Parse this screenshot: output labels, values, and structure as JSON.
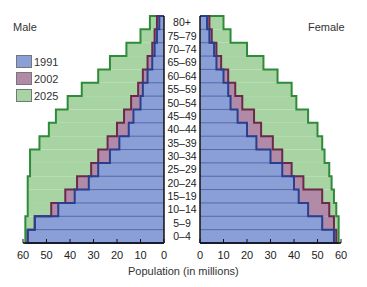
{
  "chart_data": {
    "type": "bar",
    "subtype": "population-pyramid",
    "title": "",
    "xlabel": "Population (in millions)",
    "ylabel": "",
    "side_labels": {
      "left": "Male",
      "right": "Female"
    },
    "categories": [
      "80+",
      "75–79",
      "70–74",
      "65–69",
      "60–64",
      "55–59",
      "50–54",
      "45–49",
      "40–44",
      "35–39",
      "30–34",
      "25–29",
      "20–24",
      "15–19",
      "10–14",
      "5–9",
      "0–4"
    ],
    "xlim": [
      60,
      0,
      60
    ],
    "x_ticks_left": [
      "60",
      "50",
      "40",
      "30",
      "20",
      "10",
      "0"
    ],
    "x_ticks_right": [
      "0",
      "10",
      "20",
      "30",
      "40",
      "50",
      "60"
    ],
    "legend": [
      "1991",
      "2002",
      "2025"
    ],
    "legend_position": "upper-left",
    "grid": false,
    "series": [
      {
        "name": "1991",
        "color": "#8a9fd6",
        "edge": "#2a3f8f",
        "male": [
          2,
          3,
          4,
          5,
          7,
          9,
          10,
          13,
          15,
          19,
          23,
          28,
          32,
          38,
          45,
          55,
          58
        ],
        "female": [
          3,
          4,
          6,
          7,
          10,
          12,
          13,
          16,
          20,
          24,
          30,
          35,
          40,
          42,
          46,
          52,
          57
        ]
      },
      {
        "name": "2002",
        "color": "#b08aa6",
        "edge": "#6b2a4a",
        "male": [
          3,
          4,
          5,
          7,
          9,
          11,
          14,
          17,
          20,
          24,
          28,
          31,
          37,
          42,
          48,
          55,
          58
        ],
        "female": [
          4,
          5,
          7,
          9,
          12,
          15,
          18,
          23,
          26,
          31,
          35,
          39,
          44,
          52,
          55,
          57,
          58
        ]
      },
      {
        "name": "2025",
        "color": "#a8d4a4",
        "edge": "#2e8b3a",
        "male": [
          6,
          10,
          16,
          23,
          28,
          35,
          41,
          46,
          49,
          53,
          57,
          57,
          58,
          58,
          58,
          59,
          59
        ],
        "female": [
          10,
          13,
          20,
          27,
          33,
          39,
          41,
          46,
          50,
          52,
          53,
          55,
          56,
          57,
          58,
          59,
          59
        ]
      }
    ]
  },
  "labels": {
    "male": "Male",
    "female": "Female",
    "x_title": "Population (in millions)"
  },
  "legend": [
    {
      "label": "1991",
      "color": "#8a9fd6"
    },
    {
      "label": "2002",
      "color": "#b08aa6"
    },
    {
      "label": "2025",
      "color": "#a8d4a4"
    }
  ]
}
